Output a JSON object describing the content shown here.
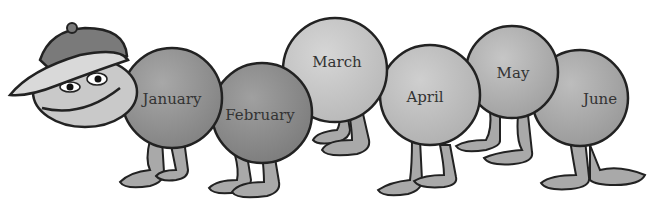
{
  "illustration": {
    "subject": "caterpillar with cap",
    "segments": [
      {
        "label": "January",
        "shade": "#8f8f8f"
      },
      {
        "label": "February",
        "shade": "#8a8a8a"
      },
      {
        "label": "March",
        "shade": "#c4c4c4"
      },
      {
        "label": "April",
        "shade": "#bdbdbd"
      },
      {
        "label": "May",
        "shade": "#adadad"
      },
      {
        "label": "June",
        "shade": "#a6a6a6"
      }
    ]
  }
}
